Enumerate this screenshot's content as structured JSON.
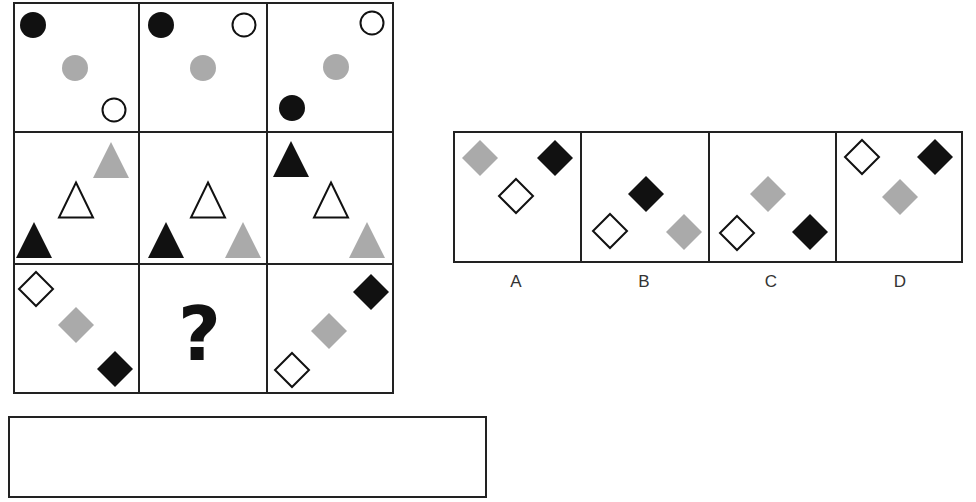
{
  "colors": {
    "black": "#111111",
    "gray": "#aaaaaa",
    "white": "#ffffff",
    "stroke": "#111111"
  },
  "matrix": {
    "rows": [
      {
        "shape": "circle",
        "cells": [
          {
            "shapes": [
              {
                "fill": "black",
                "x": 33,
                "y": 25
              },
              {
                "fill": "gray",
                "x": 75,
                "y": 68
              },
              {
                "fill": "white",
                "x": 114,
                "y": 110
              }
            ]
          },
          {
            "shapes": [
              {
                "fill": "black",
                "x": 161,
                "y": 25
              },
              {
                "fill": "white",
                "x": 244,
                "y": 25
              },
              {
                "fill": "gray",
                "x": 203,
                "y": 68
              }
            ]
          },
          {
            "shapes": [
              {
                "fill": "white",
                "x": 372,
                "y": 23
              },
              {
                "fill": "gray",
                "x": 336,
                "y": 67
              },
              {
                "fill": "black",
                "x": 292,
                "y": 108
              }
            ]
          }
        ]
      },
      {
        "shape": "triangle",
        "cells": [
          {
            "shapes": [
              {
                "fill": "gray",
                "x": 111,
                "y": 160
              },
              {
                "fill": "white",
                "x": 76,
                "y": 200
              },
              {
                "fill": "black",
                "x": 34,
                "y": 240
              }
            ]
          },
          {
            "shapes": [
              {
                "fill": "white",
                "x": 208,
                "y": 200
              },
              {
                "fill": "black",
                "x": 166,
                "y": 240
              },
              {
                "fill": "gray",
                "x": 243,
                "y": 240
              }
            ]
          },
          {
            "shapes": [
              {
                "fill": "black",
                "x": 291,
                "y": 159
              },
              {
                "fill": "white",
                "x": 331,
                "y": 200
              },
              {
                "fill": "gray",
                "x": 367,
                "y": 240
              }
            ]
          }
        ]
      },
      {
        "shape": "diamond",
        "cells": [
          {
            "shapes": [
              {
                "fill": "white",
                "x": 36,
                "y": 289
              },
              {
                "fill": "gray",
                "x": 76,
                "y": 325
              },
              {
                "fill": "black",
                "x": 115,
                "y": 369
              }
            ]
          },
          {
            "missing": true,
            "symbol": "?"
          },
          {
            "shapes": [
              {
                "fill": "black",
                "x": 371,
                "y": 292
              },
              {
                "fill": "gray",
                "x": 329,
                "y": 331
              },
              {
                "fill": "white",
                "x": 292,
                "y": 370
              }
            ]
          }
        ]
      }
    ]
  },
  "options": [
    {
      "label": "A",
      "shapes": [
        {
          "fill": "gray",
          "x": 480,
          "y": 158
        },
        {
          "fill": "black",
          "x": 555,
          "y": 158
        },
        {
          "fill": "white",
          "x": 516,
          "y": 196
        }
      ]
    },
    {
      "label": "B",
      "shapes": [
        {
          "fill": "black",
          "x": 646,
          "y": 194
        },
        {
          "fill": "white",
          "x": 610,
          "y": 231
        },
        {
          "fill": "gray",
          "x": 684,
          "y": 232
        }
      ]
    },
    {
      "label": "C",
      "shapes": [
        {
          "fill": "gray",
          "x": 768,
          "y": 194
        },
        {
          "fill": "white",
          "x": 737,
          "y": 233
        },
        {
          "fill": "black",
          "x": 810,
          "y": 232
        }
      ]
    },
    {
      "label": "D",
      "shapes": [
        {
          "fill": "white",
          "x": 862,
          "y": 157
        },
        {
          "fill": "black",
          "x": 935,
          "y": 157
        },
        {
          "fill": "gray",
          "x": 900,
          "y": 197
        }
      ]
    }
  ],
  "answer_box": {
    "value": ""
  }
}
